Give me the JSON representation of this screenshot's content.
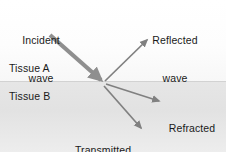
{
  "figure": {
    "width": 226,
    "height": 152,
    "background_color": "#ffffff",
    "text_color": "#1a1a1a",
    "arrow_color": "#808080",
    "incident_arrow_color": "#8c8c8c",
    "interface_color": "#d2d2d2"
  },
  "media": {
    "upper": {
      "name": "Tissue A",
      "fill_color": "#fdfdfd"
    },
    "lower": {
      "name": "Tissue B",
      "fill_color": "#e4e4e4"
    }
  },
  "labels": {
    "incident": {
      "line1": "Incident",
      "line2": "wave"
    },
    "reflected": {
      "line1": "Reflected",
      "line2": "wave"
    },
    "refracted": {
      "line1": "Refracted",
      "line2": "wave"
    },
    "transmitted": {
      "line1": "Transmitted",
      "line2": "wave"
    }
  },
  "arrows": [
    {
      "name": "incident-wave-arrow",
      "from": [
        50,
        35
      ],
      "to": [
        101,
        80
      ],
      "stroke_width": 4.2,
      "color": "#8f8f8f"
    },
    {
      "name": "reflected-wave-arrow",
      "from": [
        105,
        81
      ],
      "to": [
        147,
        40
      ],
      "stroke_width": 1.7,
      "color": "#808080"
    },
    {
      "name": "refracted-wave-arrow",
      "from": [
        106,
        84
      ],
      "to": [
        159,
        101
      ],
      "stroke_width": 1.7,
      "color": "#808080"
    },
    {
      "name": "transmitted-wave-arrow",
      "from": [
        104,
        86
      ],
      "to": [
        141,
        128
      ],
      "stroke_width": 1.7,
      "color": "#808080"
    }
  ]
}
